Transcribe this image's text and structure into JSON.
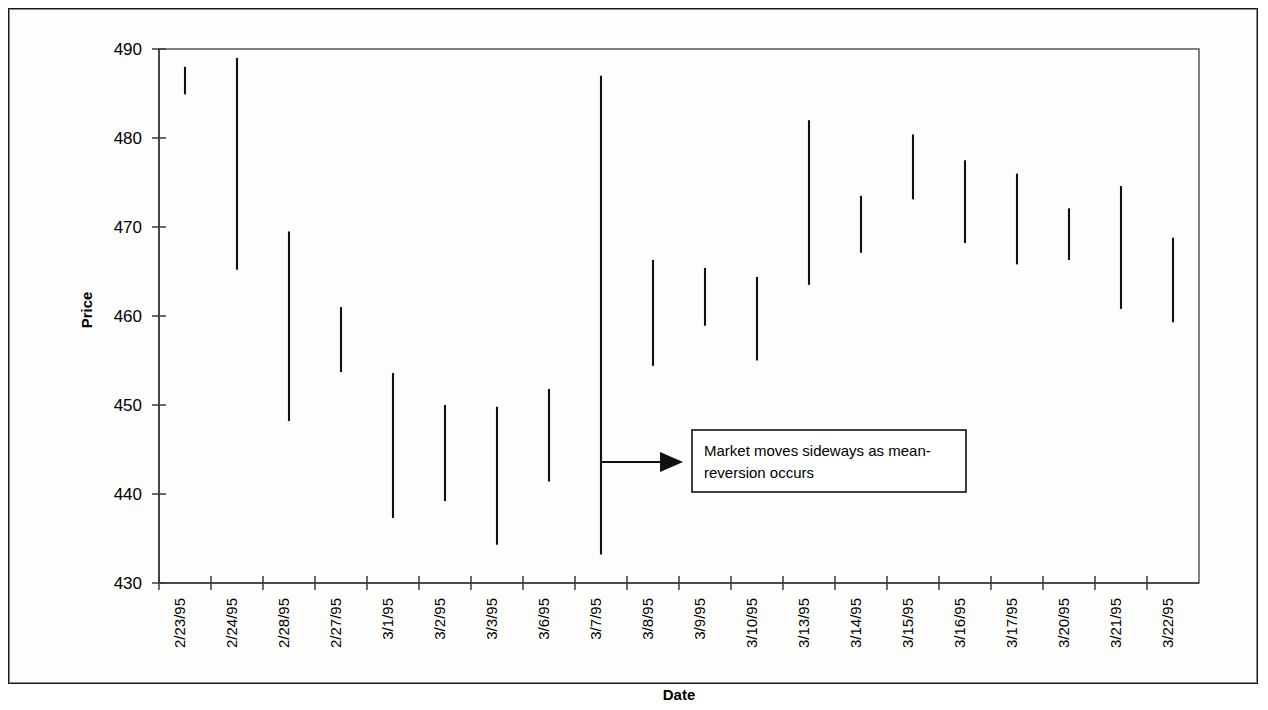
{
  "chart_data": {
    "type": "bar",
    "chart_style": "high-low range bars (OHLC bar chart)",
    "title": "",
    "xlabel": "Date",
    "ylabel": "Price",
    "ylim": [
      430,
      490
    ],
    "yticks": [
      430,
      440,
      450,
      460,
      470,
      480,
      490
    ],
    "ytick_labels": [
      "430",
      "440",
      "450",
      "460",
      "470",
      "480",
      "490"
    ],
    "grid": false,
    "legend": "none",
    "categories": [
      "2/23/95",
      "2/24/95",
      "2/28/95",
      "2/27/95",
      "3/1/95",
      "3/2/95",
      "3/3/95",
      "3/6/95",
      "3/7/95",
      "3/8/95",
      "3/9/95",
      "3/10/95",
      "3/13/95",
      "3/14/95",
      "3/15/95",
      "3/16/95",
      "3/17/95",
      "3/20/95",
      "3/21/95",
      "3/22/95"
    ],
    "series": [
      {
        "name": "High",
        "values": [
          488.0,
          489.0,
          469.5,
          461.0,
          453.6,
          450.0,
          449.8,
          451.8,
          487.0,
          466.3,
          465.4,
          464.4,
          482.0,
          473.5,
          480.4,
          477.5,
          476.0,
          472.1,
          474.6,
          468.8
        ]
      },
      {
        "name": "Low",
        "values": [
          484.9,
          465.2,
          448.2,
          453.7,
          437.3,
          439.2,
          434.3,
          441.4,
          433.2,
          454.4,
          458.9,
          455.0,
          463.5,
          467.1,
          473.1,
          468.2,
          465.8,
          466.3,
          460.8,
          459.3
        ]
      }
    ],
    "annotations": [
      {
        "id": "mean-reversion-note",
        "text": "Market moves sideways as mean-reversion occurs",
        "text_line_1": "Market moves sideways as mean-",
        "text_line_2": "reversion occurs",
        "arrow": "right-arrow",
        "points_to_x": "3/7/95"
      }
    ],
    "colors": {
      "bar": "#111111",
      "axis": "#3a3a3a",
      "text": "#000000",
      "background": "#ffffff",
      "annotation_border": "#111111"
    }
  },
  "axes": {
    "y_axis_title": "Price",
    "x_axis_title": "Date"
  }
}
